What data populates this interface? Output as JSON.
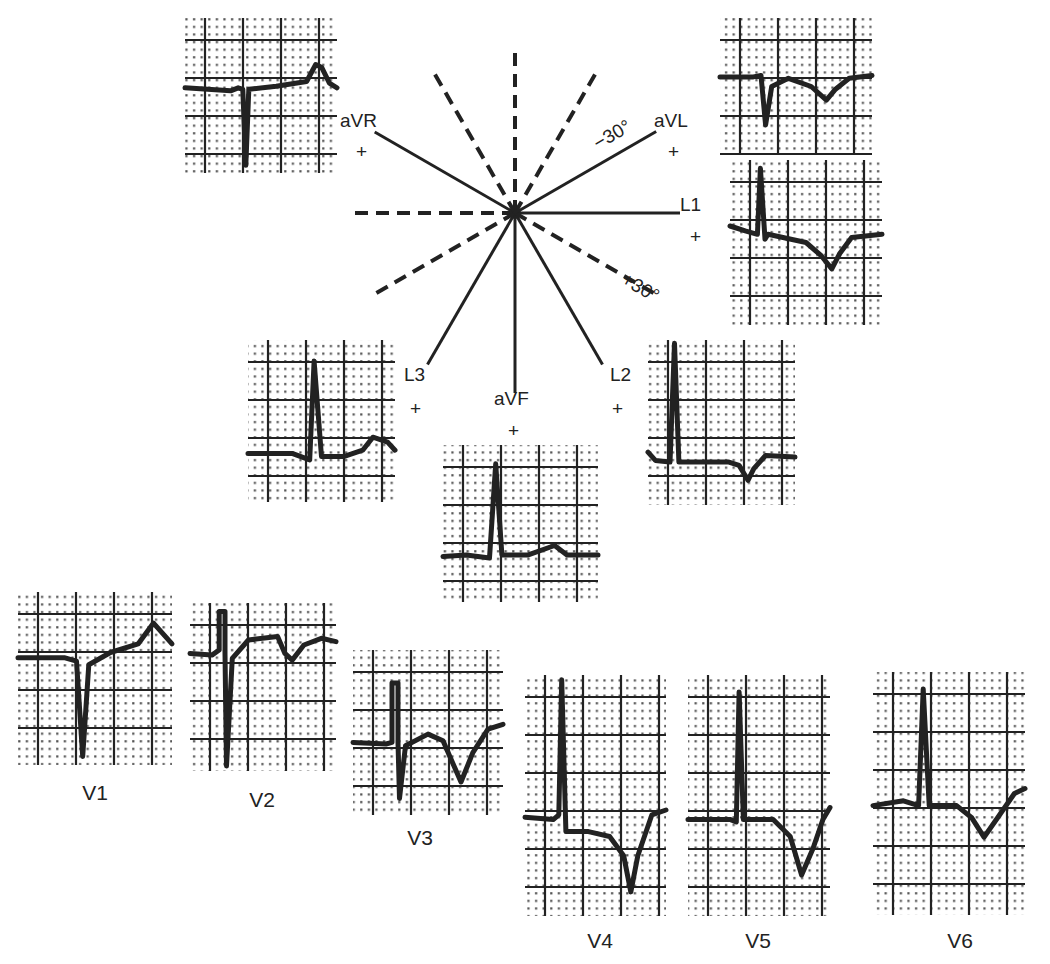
{
  "figure": {
    "background": "#ffffff",
    "ink": "#222222",
    "axis_center": [
      515,
      213
    ],
    "axes": [
      {
        "name": "L1",
        "label": "L1",
        "sign": "+",
        "angle_deg": 0,
        "style": "solid",
        "length": 165,
        "label_pos": [
          680,
          211
        ],
        "sign_pos": [
          690,
          243
        ]
      },
      {
        "name": "aVL",
        "label": "aVL",
        "sign": "+",
        "angle_deg": -30,
        "style": "solid",
        "length": 163,
        "label_pos": [
          654,
          127
        ],
        "sign_pos": [
          668,
          158
        ],
        "annotation": "−30°",
        "annotation_pos": [
          598,
          150
        ]
      },
      {
        "name": "aVR",
        "label": "aVR",
        "sign": "+",
        "angle_deg": -150,
        "style": "solid",
        "length": 162,
        "label_pos": [
          340,
          127
        ],
        "sign_pos": [
          356,
          158
        ]
      },
      {
        "name": "L2",
        "label": "L2",
        "sign": "+",
        "angle_deg": 60,
        "style": "solid",
        "length": 175,
        "label_pos": [
          610,
          381
        ],
        "sign_pos": [
          612,
          415
        ]
      },
      {
        "name": "aVF",
        "label": "aVF",
        "sign": "+",
        "angle_deg": 90,
        "style": "solid",
        "length": 180,
        "label_pos": [
          494,
          405
        ],
        "sign_pos": [
          508,
          437
        ]
      },
      {
        "name": "L3",
        "label": "L3",
        "sign": "+",
        "angle_deg": 120,
        "style": "solid",
        "length": 175,
        "label_pos": [
          404,
          381
        ],
        "sign_pos": [
          410,
          415
        ]
      },
      {
        "name": "neg-L1",
        "angle_deg": 180,
        "style": "dashed",
        "length": 165
      },
      {
        "name": "neg-aVL",
        "angle_deg": 150,
        "style": "dashed",
        "length": 165
      },
      {
        "name": "neg-aVR",
        "angle_deg": 30,
        "style": "dashed",
        "length": 165,
        "annotation": "+30°",
        "annotation_pos": [
          620,
          283
        ]
      },
      {
        "name": "neg-L2",
        "angle_deg": -120,
        "style": "dashed",
        "length": 165
      },
      {
        "name": "neg-aVF",
        "angle_deg": -90,
        "style": "dashed",
        "length": 160
      },
      {
        "name": "neg-L3",
        "angle_deg": -60,
        "style": "dashed",
        "length": 165
      }
    ],
    "leads": [
      {
        "name": "aVR",
        "x": 185,
        "y": 18,
        "w": 152,
        "h": 155,
        "caption": "",
        "trace": [
          [
            0,
            0.45
          ],
          [
            0.3,
            0.47
          ],
          [
            0.35,
            0.45
          ],
          [
            0.38,
            0.46
          ],
          [
            0.4,
            0.95
          ],
          [
            0.42,
            0.46
          ],
          [
            0.6,
            0.44
          ],
          [
            0.8,
            0.41
          ],
          [
            0.86,
            0.3
          ],
          [
            0.9,
            0.32
          ],
          [
            0.95,
            0.42
          ],
          [
            1,
            0.45
          ]
        ]
      },
      {
        "name": "aVL",
        "x": 720,
        "y": 18,
        "w": 152,
        "h": 137,
        "caption": "",
        "trace": [
          [
            0,
            0.43
          ],
          [
            0.22,
            0.43
          ],
          [
            0.27,
            0.42
          ],
          [
            0.3,
            0.78
          ],
          [
            0.34,
            0.5
          ],
          [
            0.45,
            0.44
          ],
          [
            0.6,
            0.5
          ],
          [
            0.7,
            0.6
          ],
          [
            0.76,
            0.52
          ],
          [
            0.85,
            0.44
          ],
          [
            1,
            0.42
          ]
        ]
      },
      {
        "name": "L1",
        "x": 730,
        "y": 160,
        "w": 152,
        "h": 165,
        "caption": "",
        "trace": [
          [
            0,
            0.4
          ],
          [
            0.1,
            0.43
          ],
          [
            0.18,
            0.45
          ],
          [
            0.2,
            0.05
          ],
          [
            0.23,
            0.48
          ],
          [
            0.25,
            0.45
          ],
          [
            0.5,
            0.5
          ],
          [
            0.6,
            0.58
          ],
          [
            0.67,
            0.66
          ],
          [
            0.72,
            0.57
          ],
          [
            0.8,
            0.47
          ],
          [
            1,
            0.45
          ]
        ]
      },
      {
        "name": "L3",
        "x": 248,
        "y": 340,
        "w": 147,
        "h": 162,
        "caption": "",
        "trace": [
          [
            0,
            0.7
          ],
          [
            0.3,
            0.7
          ],
          [
            0.42,
            0.74
          ],
          [
            0.45,
            0.13
          ],
          [
            0.5,
            0.72
          ],
          [
            0.65,
            0.72
          ],
          [
            0.78,
            0.68
          ],
          [
            0.85,
            0.6
          ],
          [
            0.95,
            0.63
          ],
          [
            1,
            0.68
          ]
        ]
      },
      {
        "name": "L2",
        "x": 648,
        "y": 340,
        "w": 147,
        "h": 165,
        "caption": "",
        "trace": [
          [
            0,
            0.68
          ],
          [
            0.05,
            0.73
          ],
          [
            0.15,
            0.74
          ],
          [
            0.18,
            0.02
          ],
          [
            0.21,
            0.74
          ],
          [
            0.55,
            0.74
          ],
          [
            0.62,
            0.76
          ],
          [
            0.68,
            0.85
          ],
          [
            0.72,
            0.78
          ],
          [
            0.8,
            0.7
          ],
          [
            1,
            0.71
          ]
        ]
      },
      {
        "name": "aVF",
        "x": 443,
        "y": 445,
        "w": 155,
        "h": 157,
        "caption": "",
        "trace": [
          [
            0,
            0.71
          ],
          [
            0.15,
            0.7
          ],
          [
            0.3,
            0.72
          ],
          [
            0.34,
            0.12
          ],
          [
            0.38,
            0.7
          ],
          [
            0.55,
            0.7
          ],
          [
            0.72,
            0.64
          ],
          [
            0.8,
            0.7
          ],
          [
            1,
            0.7
          ]
        ]
      },
      {
        "name": "V1",
        "x": 18,
        "y": 592,
        "w": 154,
        "h": 173,
        "caption": "V1",
        "caption_pos": [
          95,
          800
        ],
        "trace": [
          [
            0,
            0.38
          ],
          [
            0.3,
            0.38
          ],
          [
            0.38,
            0.4
          ],
          [
            0.42,
            0.95
          ],
          [
            0.46,
            0.42
          ],
          [
            0.6,
            0.35
          ],
          [
            0.78,
            0.3
          ],
          [
            0.88,
            0.18
          ],
          [
            1,
            0.3
          ]
        ]
      },
      {
        "name": "V2",
        "x": 190,
        "y": 603,
        "w": 146,
        "h": 168,
        "caption": "V2",
        "caption_pos": [
          262,
          807
        ],
        "trace": [
          [
            0,
            0.3
          ],
          [
            0.15,
            0.31
          ],
          [
            0.2,
            0.28
          ],
          [
            0.2,
            0.05
          ],
          [
            0.24,
            0.05
          ],
          [
            0.24,
            0.3
          ],
          [
            0.25,
            0.97
          ],
          [
            0.29,
            0.33
          ],
          [
            0.4,
            0.22
          ],
          [
            0.6,
            0.2
          ],
          [
            0.65,
            0.3
          ],
          [
            0.7,
            0.34
          ],
          [
            0.78,
            0.25
          ],
          [
            0.9,
            0.21
          ],
          [
            1,
            0.23
          ]
        ]
      },
      {
        "name": "V3",
        "x": 353,
        "y": 650,
        "w": 150,
        "h": 165,
        "caption": "V3",
        "caption_pos": [
          420,
          845
        ],
        "trace": [
          [
            0,
            0.56
          ],
          [
            0.22,
            0.57
          ],
          [
            0.26,
            0.56
          ],
          [
            0.26,
            0.2
          ],
          [
            0.3,
            0.2
          ],
          [
            0.3,
            0.56
          ],
          [
            0.31,
            0.9
          ],
          [
            0.35,
            0.58
          ],
          [
            0.5,
            0.51
          ],
          [
            0.6,
            0.55
          ],
          [
            0.72,
            0.8
          ],
          [
            0.8,
            0.62
          ],
          [
            0.9,
            0.48
          ],
          [
            1,
            0.45
          ]
        ]
      },
      {
        "name": "V4",
        "x": 525,
        "y": 675,
        "w": 141,
        "h": 241,
        "caption": "V4",
        "caption_pos": [
          600,
          948
        ],
        "trace": [
          [
            0,
            0.59
          ],
          [
            0.2,
            0.6
          ],
          [
            0.24,
            0.58
          ],
          [
            0.26,
            0.02
          ],
          [
            0.29,
            0.65
          ],
          [
            0.45,
            0.65
          ],
          [
            0.6,
            0.67
          ],
          [
            0.7,
            0.75
          ],
          [
            0.75,
            0.9
          ],
          [
            0.8,
            0.75
          ],
          [
            0.9,
            0.58
          ],
          [
            1,
            0.56
          ]
        ]
      },
      {
        "name": "V5",
        "x": 688,
        "y": 675,
        "w": 142,
        "h": 241,
        "caption": "V5",
        "caption_pos": [
          758,
          948
        ],
        "trace": [
          [
            0,
            0.6
          ],
          [
            0.3,
            0.6
          ],
          [
            0.34,
            0.61
          ],
          [
            0.36,
            0.07
          ],
          [
            0.39,
            0.6
          ],
          [
            0.6,
            0.6
          ],
          [
            0.72,
            0.67
          ],
          [
            0.8,
            0.83
          ],
          [
            0.88,
            0.72
          ],
          [
            0.95,
            0.6
          ],
          [
            1,
            0.55
          ]
        ]
      },
      {
        "name": "V6",
        "x": 873,
        "y": 672,
        "w": 152,
        "h": 243,
        "caption": "V6",
        "caption_pos": [
          960,
          948
        ],
        "trace": [
          [
            0,
            0.55
          ],
          [
            0.2,
            0.53
          ],
          [
            0.3,
            0.55
          ],
          [
            0.33,
            0.07
          ],
          [
            0.37,
            0.55
          ],
          [
            0.55,
            0.55
          ],
          [
            0.65,
            0.6
          ],
          [
            0.73,
            0.68
          ],
          [
            0.82,
            0.6
          ],
          [
            0.93,
            0.5
          ],
          [
            1,
            0.48
          ]
        ]
      }
    ]
  }
}
